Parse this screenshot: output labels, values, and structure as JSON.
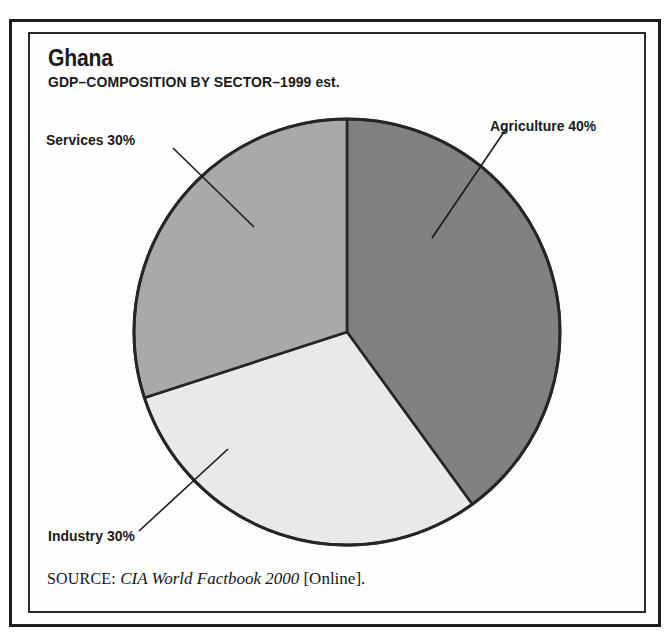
{
  "figure": {
    "title": "Ghana",
    "subtitle": "GDP–COMPOSITION BY SECTOR–1999 est.",
    "source_prefix": "SOURCE:",
    "source_title": "CIA World Factbook 2000",
    "source_suffix": "[Online].",
    "frame_color": "#1c1c1c",
    "background": "#ffffff"
  },
  "labels": {
    "agriculture": "Agriculture 40%",
    "services": "Services 30%",
    "industry": "Industry 30%"
  },
  "chart_data": {
    "type": "pie",
    "title": "Ghana",
    "subtitle": "GDP–COMPOSITION BY SECTOR–1999 est.",
    "xlabel": "",
    "ylabel": "",
    "categories": [
      "Agriculture",
      "Industry",
      "Services"
    ],
    "values": [
      40,
      30,
      30
    ],
    "unit": "%",
    "value_labels": [
      "40%",
      "30%",
      "30%"
    ],
    "slice_colors": [
      "#818181",
      "#e9e9e9",
      "#a9a9a9"
    ],
    "slice_edge_color": "#262626",
    "start_angle_deg": 0,
    "direction": "clockwise",
    "legend": "none",
    "annotations": [
      {
        "text": "Agriculture 40%",
        "slice": "Agriculture",
        "position": "right",
        "leader_line": true
      },
      {
        "text": "Services 30%",
        "slice": "Services",
        "position": "upper-left",
        "leader_line": true
      },
      {
        "text": "Industry 30%",
        "slice": "Industry",
        "position": "lower-left",
        "leader_line": true
      }
    ],
    "grid": false,
    "total": 100
  }
}
